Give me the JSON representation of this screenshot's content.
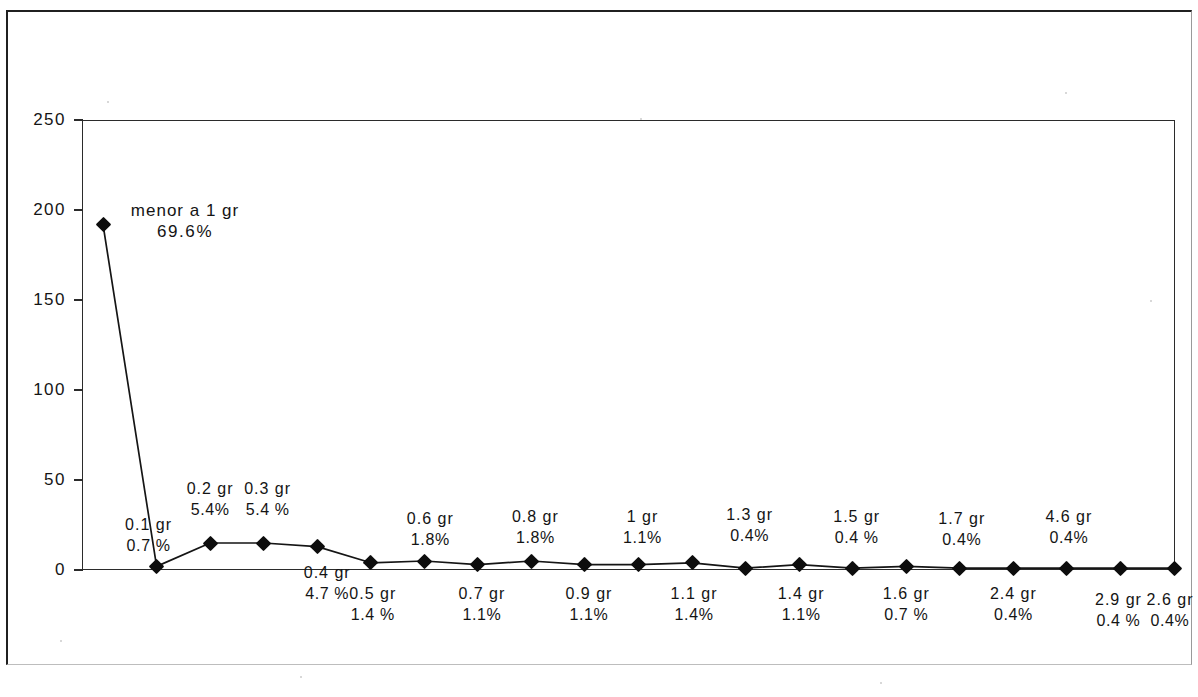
{
  "chart_data": {
    "type": "line",
    "title": "",
    "subtitle": "",
    "xlabel": "",
    "ylabel": "",
    "grid": false,
    "legend": "none",
    "ylim": [
      0,
      250
    ],
    "ytick_labels": [
      "0",
      "50",
      "100",
      "150",
      "200",
      "250"
    ],
    "ytick_values": [
      0,
      50,
      100,
      150,
      200,
      250
    ],
    "marker": "filled-diamond",
    "line_color": "#151515",
    "marker_color": "#0d0d0d",
    "categories": [
      "menor a 1 gr",
      "0.1 gr",
      "0.2 gr",
      "0.3 gr",
      "0.4 gr",
      "0.5 gr",
      "0.6 gr",
      "0.7 gr",
      "0.8 gr",
      "0.9 gr",
      "1 gr",
      "1.1 gr",
      "1.3 gr",
      "1.4 gr",
      "1.5 gr",
      "1.6 gr",
      "1.7 gr",
      "2.4 gr",
      "4.6 gr",
      "2.9 gr",
      "2.6 gr"
    ],
    "values": [
      192,
      2,
      15,
      15,
      13,
      4,
      5,
      3,
      5,
      3,
      3,
      4,
      1,
      3,
      1,
      2,
      1,
      1,
      1,
      1,
      1
    ],
    "percent_labels": [
      "69.6%",
      "0.7 %",
      "5.4%",
      "5.4 %",
      "4.7 %",
      "1.4 %",
      "1.8%",
      "1.1%",
      "1.8%",
      "1.1%",
      "1.1%",
      "1.4%",
      "0.4%",
      "1.1%",
      "0.4 %",
      "0.7 %",
      "0.4%",
      "0.4%",
      "0.4%",
      "0.4 %",
      "0.4%"
    ],
    "percent_values": [
      69.6,
      0.7,
      5.4,
      5.4,
      4.7,
      1.4,
      1.8,
      1.1,
      1.8,
      1.1,
      1.1,
      1.4,
      0.4,
      1.1,
      0.4,
      0.7,
      0.4,
      0.4,
      0.4,
      0.4,
      0.4
    ],
    "label_positions": [
      "above",
      "above",
      "above",
      "above",
      "below",
      "below",
      "above",
      "below",
      "above",
      "below",
      "above",
      "below",
      "above",
      "below",
      "above",
      "below",
      "above",
      "below",
      "above",
      "below",
      "below"
    ]
  },
  "points": [
    {
      "name": "menor a 1 gr",
      "pct": "69.6%",
      "value": 192,
      "pos": "above"
    },
    {
      "name": "0.1 gr",
      "pct": "0.7 %",
      "value": 2,
      "pos": "above"
    },
    {
      "name": "0.2 gr",
      "pct": "5.4%",
      "value": 15,
      "pos": "above"
    },
    {
      "name": "0.3 gr",
      "pct": "5.4 %",
      "value": 15,
      "pos": "above"
    },
    {
      "name": "0.4 gr",
      "pct": "4.7 %",
      "value": 13,
      "pos": "below"
    },
    {
      "name": "0.5 gr",
      "pct": "1.4 %",
      "value": 4,
      "pos": "below"
    },
    {
      "name": "0.6 gr",
      "pct": "1.8%",
      "value": 5,
      "pos": "above"
    },
    {
      "name": "0.7 gr",
      "pct": "1.1%",
      "value": 3,
      "pos": "below"
    },
    {
      "name": "0.8 gr",
      "pct": "1.8%",
      "value": 5,
      "pos": "above"
    },
    {
      "name": "0.9 gr",
      "pct": "1.1%",
      "value": 3,
      "pos": "below"
    },
    {
      "name": "1 gr",
      "pct": "1.1%",
      "value": 3,
      "pos": "above"
    },
    {
      "name": "1.1 gr",
      "pct": "1.4%",
      "value": 4,
      "pos": "below"
    },
    {
      "name": "1.3 gr",
      "pct": "0.4%",
      "value": 1,
      "pos": "above"
    },
    {
      "name": "1.4 gr",
      "pct": "1.1%",
      "value": 3,
      "pos": "below"
    },
    {
      "name": "1.5 gr",
      "pct": "0.4 %",
      "value": 1,
      "pos": "above"
    },
    {
      "name": "1.6 gr",
      "pct": "0.7 %",
      "value": 2,
      "pos": "below"
    },
    {
      "name": "1.7 gr",
      "pct": "0.4%",
      "value": 1,
      "pos": "above"
    },
    {
      "name": "2.4 gr",
      "pct": "0.4%",
      "value": 1,
      "pos": "below"
    },
    {
      "name": "4.6 gr",
      "pct": "0.4%",
      "value": 1,
      "pos": "above"
    },
    {
      "name": "2.9 gr",
      "pct": "0.4 %",
      "value": 1,
      "pos": "below"
    },
    {
      "name": "2.6 gr",
      "pct": "0.4%",
      "value": 1,
      "pos": "below"
    }
  ],
  "y_axis": {
    "ticks": [
      "250",
      "200",
      "150",
      "100",
      "50",
      "0"
    ]
  }
}
